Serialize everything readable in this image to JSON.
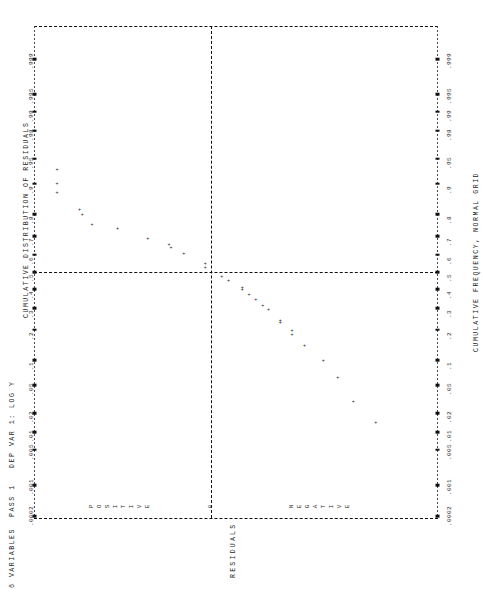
{
  "page": {
    "orientation": "rotated-90-ccw",
    "background": "#ffffff",
    "ink": "#111111"
  },
  "labels": {
    "header_left": "6 VARIABLES  PASS 1   DEP VAR 1: LOG Y",
    "top_axis_title": "CUMULATIVE DISTRIBUTION OF RESIDUALS",
    "bottom_axis_title": "CUMULATIVE FREQUENCY, NORMAL GRID",
    "residual_axis_title": "RESIDUALS",
    "positive_label": "POSITIVE",
    "zero_label": "0",
    "negative_label": "NEGATIVE"
  },
  "chart_data": {
    "type": "scatter",
    "title": "CUMULATIVE DISTRIBUTION OF RESIDUALS",
    "subtitle": "CUMULATIVE FREQUENCY, NORMAL GRID",
    "xlabel": "RESIDUALS",
    "ylabel": "CUMULATIVE FREQUENCY",
    "grid": true,
    "legend": "none",
    "note": "Normal probability plot printed on a line printer; the page is rotated 90 degrees so the probability axis runs along the picture's vertical edges and the residual axis runs along the picture's horizontal extent.",
    "prob_axis_ticks": [
      ".999",
      ".995",
      ".99",
      ".98",
      ".95",
      ".9",
      ".8",
      ".7",
      ".6",
      ".5",
      ".4",
      ".3",
      ".2",
      ".1",
      ".05",
      ".02",
      ".01",
      ".005",
      ".001",
      ".0002"
    ],
    "prob_axis_tick_positions": [
      0.999,
      0.995,
      0.99,
      0.98,
      0.95,
      0.9,
      0.8,
      0.7,
      0.6,
      0.5,
      0.4,
      0.3,
      0.2,
      0.1,
      0.05,
      0.02,
      0.01,
      0.005,
      0.001,
      0.0002
    ],
    "residual_axis_categories": [
      "POSITIVE",
      "0",
      "NEGATIVE"
    ],
    "reference_lines": [
      {
        "name": "median-line",
        "prob": 0.5,
        "style": "dashed"
      },
      {
        "name": "zero-residual-line",
        "residual": 0,
        "style": "dashed"
      }
    ],
    "points": [
      {
        "prob": 0.98,
        "residual": 0.905
      },
      {
        "prob": 0.93,
        "residual": 0.79
      },
      {
        "prob": 0.9,
        "residual": 0.79
      },
      {
        "prob": 0.875,
        "residual": 0.79
      },
      {
        "prob": 0.815,
        "residual": 0.675
      },
      {
        "prob": 0.795,
        "residual": 0.66
      },
      {
        "prob": 0.755,
        "residual": 0.61
      },
      {
        "prob": 0.735,
        "residual": 0.48
      },
      {
        "prob": 0.685,
        "residual": 0.325
      },
      {
        "prob": 0.655,
        "residual": 0.215
      },
      {
        "prob": 0.635,
        "residual": 0.205
      },
      {
        "prob": 0.605,
        "residual": 0.14
      },
      {
        "prob": 0.545,
        "residual": 0.03
      },
      {
        "prob": 0.525,
        "residual": 0.03
      },
      {
        "prob": 0.47,
        "residual": -0.055
      },
      {
        "prob": 0.45,
        "residual": -0.09
      },
      {
        "prob": 0.408,
        "residual": -0.16
      },
      {
        "prob": 0.398,
        "residual": -0.16
      },
      {
        "prob": 0.368,
        "residual": -0.195
      },
      {
        "prob": 0.34,
        "residual": -0.23
      },
      {
        "prob": 0.31,
        "residual": -0.265
      },
      {
        "prob": 0.288,
        "residual": -0.295
      },
      {
        "prob": 0.238,
        "residual": -0.355
      },
      {
        "prob": 0.228,
        "residual": -0.355
      },
      {
        "prob": 0.195,
        "residual": -0.415
      },
      {
        "prob": 0.178,
        "residual": -0.415
      },
      {
        "prob": 0.142,
        "residual": -0.48
      },
      {
        "prob": 0.098,
        "residual": -0.575
      },
      {
        "prob": 0.062,
        "residual": -0.65
      },
      {
        "prob": 0.03,
        "residual": -0.73
      },
      {
        "prob": 0.014,
        "residual": -0.845
      }
    ]
  }
}
